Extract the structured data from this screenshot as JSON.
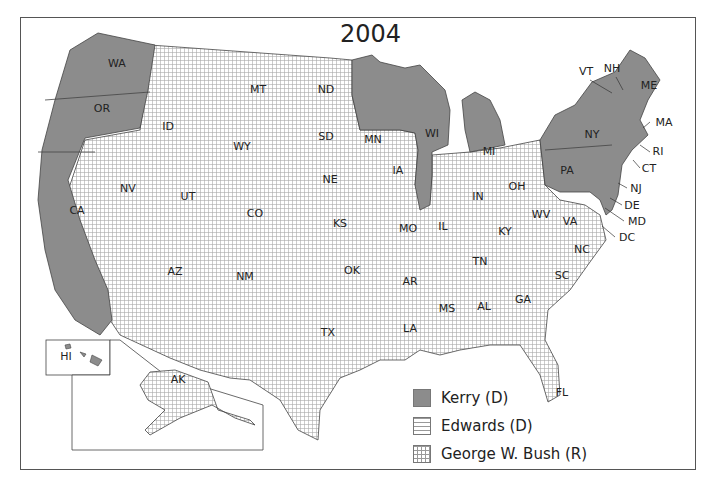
{
  "map": {
    "title": "2004",
    "legend": [
      {
        "label": "Kerry (D)",
        "pattern": "solid-gray",
        "color": "#8c8c8c"
      },
      {
        "label": "Edwards (D)",
        "pattern": "horizontal-lines"
      },
      {
        "label": "George W. Bush (R)",
        "pattern": "grid"
      }
    ],
    "states": {
      "kerry": [
        "WA",
        "OR",
        "CA",
        "MN",
        "WI",
        "MI",
        "IL",
        "PA",
        "NY",
        "VT",
        "NH",
        "ME",
        "MA",
        "RI",
        "CT",
        "NJ",
        "DE",
        "MD",
        "DC",
        "HI"
      ],
      "bush": [
        "MT",
        "ID",
        "WY",
        "NV",
        "UT",
        "CO",
        "AZ",
        "NM",
        "ND",
        "SD",
        "NE",
        "KS",
        "OK",
        "TX",
        "IA",
        "MO",
        "AR",
        "LA",
        "MS",
        "AL",
        "GA",
        "FL",
        "SC",
        "NC",
        "TN",
        "KY",
        "IN",
        "OH",
        "WV",
        "VA",
        "AK"
      ],
      "edwards": []
    },
    "labels": {
      "WA": "WA",
      "OR": "OR",
      "CA": "CA",
      "NV": "NV",
      "ID": "ID",
      "MT": "MT",
      "WY": "WY",
      "UT": "UT",
      "CO": "CO",
      "AZ": "AZ",
      "NM": "NM",
      "ND": "ND",
      "SD": "SD",
      "NE": "NE",
      "KS": "KS",
      "OK": "OK",
      "TX": "TX",
      "MN": "MN",
      "IA": "IA",
      "MO": "MO",
      "AR": "AR",
      "LA": "LA",
      "WI": "WI",
      "IL": "IL",
      "MI": "MI",
      "IN": "IN",
      "OH": "OH",
      "KY": "KY",
      "TN": "TN",
      "MS": "MS",
      "AL": "AL",
      "GA": "GA",
      "FL": "FL",
      "SC": "SC",
      "NC": "NC",
      "VA": "VA",
      "WV": "WV",
      "PA": "PA",
      "NY": "NY",
      "VT": "VT",
      "NH": "NH",
      "ME": "ME",
      "MA": "MA",
      "RI": "RI",
      "CT": "CT",
      "NJ": "NJ",
      "DE": "DE",
      "MD": "MD",
      "DC": "DC",
      "HI": "HI",
      "AK": "AK"
    }
  }
}
